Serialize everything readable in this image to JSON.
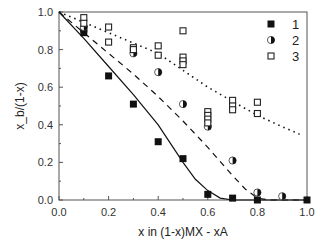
{
  "chart_data": {
    "type": "scatter",
    "title": "",
    "xlabel": "x in (1-x)MX - xA",
    "ylabel": "x_b/(1-x)",
    "xlim": [
      0.0,
      1.0
    ],
    "ylim": [
      0.0,
      1.0
    ],
    "xticks": [
      "0.0",
      "0.2",
      "0.4",
      "0.6",
      "0.8",
      "1.0"
    ],
    "yticks": [
      "0.0",
      "0.2",
      "0.4",
      "0.6",
      "0.8",
      "1.0"
    ],
    "grid": false,
    "legend_position": "upper right",
    "series": [
      {
        "name": "1",
        "marker": "filled-square",
        "line": "solid",
        "points": [
          [
            0.1,
            0.91
          ],
          [
            0.1,
            0.89
          ],
          [
            0.2,
            0.66
          ],
          [
            0.3,
            0.51
          ],
          [
            0.4,
            0.31
          ],
          [
            0.5,
            0.22
          ],
          [
            0.6,
            0.03
          ],
          [
            0.7,
            0.01
          ],
          [
            0.8,
            0.0
          ],
          [
            1.0,
            0.0
          ]
        ],
        "fit": [
          [
            0.0,
            1.0
          ],
          [
            0.1,
            0.86
          ],
          [
            0.2,
            0.71
          ],
          [
            0.3,
            0.56
          ],
          [
            0.4,
            0.4
          ],
          [
            0.45,
            0.3
          ],
          [
            0.5,
            0.2
          ],
          [
            0.55,
            0.11
          ],
          [
            0.6,
            0.05
          ],
          [
            0.65,
            0.01
          ],
          [
            0.7,
            0.0
          ],
          [
            1.0,
            0.0
          ]
        ]
      },
      {
        "name": "2",
        "marker": "half-filled-circle",
        "line": "dashed",
        "points": [
          [
            0.1,
            0.92
          ],
          [
            0.3,
            0.78
          ],
          [
            0.4,
            0.68
          ],
          [
            0.5,
            0.51
          ],
          [
            0.6,
            0.39
          ],
          [
            0.7,
            0.21
          ],
          [
            0.8,
            0.04
          ],
          [
            0.9,
            0.02
          ]
        ],
        "fit": [
          [
            0.0,
            1.0
          ],
          [
            0.1,
            0.89
          ],
          [
            0.2,
            0.78
          ],
          [
            0.3,
            0.67
          ],
          [
            0.4,
            0.55
          ],
          [
            0.5,
            0.42
          ],
          [
            0.6,
            0.28
          ],
          [
            0.7,
            0.13
          ],
          [
            0.75,
            0.06
          ],
          [
            0.8,
            0.01
          ],
          [
            0.85,
            0.0
          ],
          [
            1.0,
            0.0
          ]
        ]
      },
      {
        "name": "3",
        "marker": "open-square",
        "line": "dotted",
        "points": [
          [
            0.1,
            0.97
          ],
          [
            0.1,
            0.94
          ],
          [
            0.2,
            0.92
          ],
          [
            0.2,
            0.84
          ],
          [
            0.3,
            0.81
          ],
          [
            0.3,
            0.8
          ],
          [
            0.4,
            0.82
          ],
          [
            0.4,
            0.77
          ],
          [
            0.5,
            0.9
          ],
          [
            0.5,
            0.76
          ],
          [
            0.5,
            0.74
          ],
          [
            0.5,
            0.72
          ],
          [
            0.6,
            0.47
          ],
          [
            0.6,
            0.45
          ],
          [
            0.6,
            0.43
          ],
          [
            0.6,
            0.41
          ],
          [
            0.7,
            0.53
          ],
          [
            0.7,
            0.5
          ],
          [
            0.7,
            0.48
          ],
          [
            0.8,
            0.52
          ],
          [
            0.8,
            0.46
          ]
        ],
        "fit": [
          [
            0.0,
            1.0
          ],
          [
            0.2,
            0.89
          ],
          [
            0.4,
            0.78
          ],
          [
            0.6,
            0.6
          ],
          [
            0.8,
            0.45
          ],
          [
            0.9,
            0.39
          ],
          [
            0.97,
            0.35
          ]
        ]
      }
    ]
  },
  "colors": {
    "marker": "#111111",
    "axis": "#444444",
    "background": "#ffffff"
  }
}
